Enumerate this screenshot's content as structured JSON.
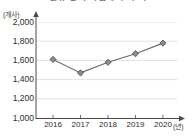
{
  "chart": {
    "title": "신규 등록 사업체 수 추이",
    "y_unit_label": "(개사)",
    "x_unit_label": "(년)",
    "yticks": [
      "2,000",
      "1,800",
      "1,600",
      "1,400",
      "1,200",
      "1,000"
    ],
    "xticks": [
      "2016",
      "2017",
      "2018",
      "2019",
      "2020"
    ],
    "colors": {
      "line": "#6b6b6b",
      "marker_fill": "#8c8c8c",
      "marker_edge": "#4a4a4a",
      "grid": "#d9d9d9",
      "axis": "#4a4a4a",
      "text": "#2b2b2b",
      "background": "#ffffff"
    }
  },
  "chart_data": {
    "type": "line",
    "title": "신규 등록 사업체 수 추이",
    "xlabel": "(년)",
    "ylabel": "(개사)",
    "categories": [
      "2016",
      "2017",
      "2018",
      "2019",
      "2020"
    ],
    "values": [
      1610,
      1470,
      1580,
      1670,
      1780
    ],
    "series": [
      {
        "name": "사업체 수",
        "values": [
          1610,
          1470,
          1580,
          1670,
          1780
        ]
      }
    ],
    "ylim": [
      1000,
      2000
    ],
    "ytick_values": [
      1000,
      1200,
      1400,
      1600,
      1800,
      2000
    ],
    "grid": true,
    "legend": "none",
    "marker": "diamond"
  }
}
